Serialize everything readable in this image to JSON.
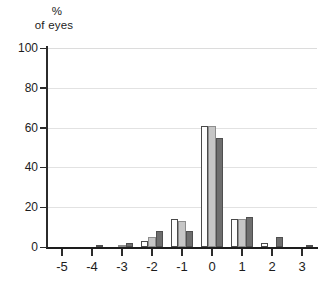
{
  "chart_data": {
    "type": "bar",
    "title": "",
    "subtitle": "",
    "xlabel": "",
    "ylabel": "% of eyes",
    "ylabel_lines": [
      "%",
      "of eyes"
    ],
    "categories": [
      "-5",
      "-4",
      "-3",
      "-2",
      "-1",
      "0",
      "1",
      "2",
      "3"
    ],
    "x": [
      -5,
      -4,
      -3,
      -2,
      -1,
      0,
      1,
      2,
      3
    ],
    "series": [
      {
        "name": "series-1",
        "color": "#fdfdfd",
        "values": [
          0,
          0,
          0,
          3,
          14,
          61,
          14,
          2,
          0
        ]
      },
      {
        "name": "series-2",
        "color": "#c6c6c6",
        "values": [
          0,
          0,
          0.5,
          5,
          13,
          61,
          14,
          0,
          0
        ]
      },
      {
        "name": "series-3",
        "color": "#6e6e6e",
        "values": [
          0,
          0.5,
          2,
          8,
          8,
          55,
          15,
          5,
          0.5
        ]
      }
    ],
    "ylim": [
      0,
      100
    ],
    "yticks": [
      0,
      20,
      40,
      60,
      80,
      100
    ],
    "ytick_labels": [
      "0",
      "20",
      "40",
      "60",
      "80",
      "100"
    ],
    "grid": true,
    "grid_axis": "y",
    "legend": "none",
    "legend_position": "none"
  },
  "colors": {
    "axis": "#1d1d1d",
    "grid": "#e2e2e2",
    "text": "#1c1c1c",
    "background": "#ffffff"
  }
}
